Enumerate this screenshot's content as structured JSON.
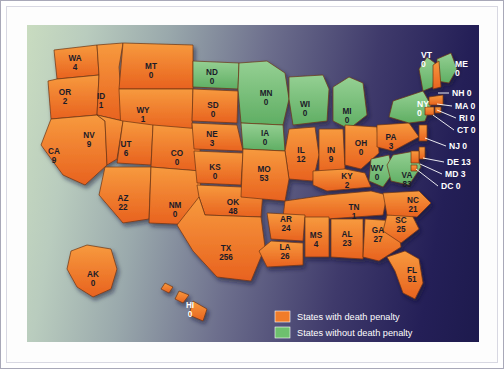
{
  "map": {
    "title": "US death penalty map",
    "background_gradient_from": "#c9dcc0",
    "background_gradient_to": "#1d1a4d",
    "ocean_color": "#1d1a4d",
    "with_penalty_color": "#f07c2a",
    "without_penalty_color": "#7dc67f",
    "border_color": "#6b3312"
  },
  "legend": {
    "items": [
      {
        "key": "with",
        "label": "States with death penalty",
        "color": "#f07c2a"
      },
      {
        "key": "without",
        "label": "States without death penalty",
        "color": "#6ec06e"
      }
    ]
  },
  "chart_data": {
    "type": "map",
    "title": "States with death penalty",
    "value_label": "Executions",
    "categories": [
      "with death penalty",
      "without death penalty"
    ],
    "states": [
      {
        "code": "WA",
        "name": "Washington",
        "value": 4,
        "penalty": "with",
        "x": 48,
        "y": 36,
        "label_anchor": "middle"
      },
      {
        "code": "OR",
        "name": "Oregon",
        "value": 2,
        "penalty": "with",
        "x": 38,
        "y": 70
      },
      {
        "code": "ID",
        "name": "Idaho",
        "value": 1,
        "penalty": "with",
        "x": 74,
        "y": 74
      },
      {
        "code": "MT",
        "name": "Montana",
        "value": 0,
        "penalty": "with",
        "x": 124,
        "y": 44
      },
      {
        "code": "ND",
        "name": "North Dakota",
        "value": 0,
        "penalty": "without",
        "x": 185,
        "y": 50
      },
      {
        "code": "SD",
        "name": "South Dakota",
        "value": 0,
        "penalty": "with",
        "x": 186,
        "y": 83
      },
      {
        "code": "MN",
        "name": "Minnesota",
        "value": 0,
        "penalty": "without",
        "x": 239,
        "y": 71
      },
      {
        "code": "WI",
        "name": "Wisconsin",
        "value": 0,
        "penalty": "without",
        "x": 278,
        "y": 82
      },
      {
        "code": "MI",
        "name": "Michigan",
        "value": 0,
        "penalty": "without",
        "x": 320,
        "y": 89
      },
      {
        "code": "IA",
        "name": "Iowa",
        "value": 0,
        "penalty": "without",
        "x": 238,
        "y": 111
      },
      {
        "code": "WY",
        "name": "Wyoming",
        "value": 1,
        "penalty": "with",
        "x": 116,
        "y": 88
      },
      {
        "code": "NE",
        "name": "Nebraska",
        "value": 3,
        "penalty": "with",
        "x": 185,
        "y": 112
      },
      {
        "code": "NV",
        "name": "Nevada",
        "value": 9,
        "penalty": "with",
        "x": 62,
        "y": 113
      },
      {
        "code": "UT",
        "name": "Utah",
        "value": 6,
        "penalty": "with",
        "x": 99,
        "y": 122
      },
      {
        "code": "CO",
        "name": "Colorado",
        "value": 0,
        "penalty": "with",
        "x": 150,
        "y": 131
      },
      {
        "code": "CA",
        "name": "California",
        "value": 9,
        "penalty": "with",
        "x": 27,
        "y": 129
      },
      {
        "code": "KS",
        "name": "Kansas",
        "value": 0,
        "penalty": "with",
        "x": 188,
        "y": 145
      },
      {
        "code": "MO",
        "name": "Missouri",
        "value": 53,
        "penalty": "with",
        "x": 237,
        "y": 147
      },
      {
        "code": "IL",
        "name": "Illinois",
        "value": 12,
        "penalty": "with",
        "x": 274,
        "y": 128
      },
      {
        "code": "IN",
        "name": "Indiana",
        "value": 9,
        "penalty": "with",
        "x": 304,
        "y": 128
      },
      {
        "code": "OH",
        "name": "Ohio",
        "value": 0,
        "penalty": "with",
        "x": 334,
        "y": 121
      },
      {
        "code": "KY",
        "name": "Kentucky",
        "value": 2,
        "penalty": "with",
        "x": 320,
        "y": 154
      },
      {
        "code": "WV",
        "name": "West Virginia",
        "value": 0,
        "penalty": "without",
        "x": 350,
        "y": 146
      },
      {
        "code": "PA",
        "name": "Pennsylvania",
        "value": 3,
        "penalty": "with",
        "x": 364,
        "y": 115
      },
      {
        "code": "VA",
        "name": "Virginia",
        "value": 83,
        "penalty": "with",
        "x": 380,
        "y": 153
      },
      {
        "code": "NC",
        "name": "North Carolina",
        "value": 21,
        "penalty": "with",
        "x": 386,
        "y": 178
      },
      {
        "code": "SC",
        "name": "South Carolina",
        "value": 25,
        "penalty": "with",
        "x": 374,
        "y": 198
      },
      {
        "code": "TN",
        "name": "Tennessee",
        "value": 1,
        "penalty": "with",
        "x": 327,
        "y": 185
      },
      {
        "code": "AR",
        "name": "Arkansas",
        "value": 24,
        "penalty": "with",
        "x": 259,
        "y": 197
      },
      {
        "code": "MS",
        "name": "Mississippi",
        "value": 4,
        "penalty": "with",
        "x": 289,
        "y": 213
      },
      {
        "code": "AL",
        "name": "Alabama",
        "value": 23,
        "penalty": "with",
        "x": 320,
        "y": 212
      },
      {
        "code": "GA",
        "name": "Georgia",
        "value": 27,
        "penalty": "with",
        "x": 351,
        "y": 208
      },
      {
        "code": "LA",
        "name": "Louisiana",
        "value": 26,
        "penalty": "with",
        "x": 258,
        "y": 225
      },
      {
        "code": "OK",
        "name": "Oklahoma",
        "value": 48,
        "penalty": "with",
        "x": 206,
        "y": 180
      },
      {
        "code": "NM",
        "name": "New Mexico",
        "value": 0,
        "penalty": "with",
        "x": 148,
        "y": 183
      },
      {
        "code": "AZ",
        "name": "Arizona",
        "value": 22,
        "penalty": "with",
        "x": 96,
        "y": 176
      },
      {
        "code": "TX",
        "name": "Texas",
        "value": 256,
        "penalty": "with",
        "x": 199,
        "y": 226
      },
      {
        "code": "FL",
        "name": "Florida",
        "value": 51,
        "penalty": "with",
        "x": 385,
        "y": 248
      },
      {
        "code": "AK",
        "name": "Alaska",
        "value": 0,
        "penalty": "with",
        "x": 66,
        "y": 252
      },
      {
        "code": "HI",
        "name": "Hawaii",
        "value": 0,
        "penalty": "with",
        "x": 163,
        "y": 283
      }
    ],
    "callouts": [
      {
        "code": "VT",
        "name": "Vermont",
        "value": 0,
        "penalty": "without",
        "text": "VT",
        "value_text": "0",
        "tx": 394,
        "ty": 33,
        "stacked": true
      },
      {
        "code": "ME",
        "name": "Maine",
        "value": 0,
        "penalty": "without",
        "text": "ME",
        "value_text": "0",
        "tx": 428,
        "ty": 42,
        "stacked": true
      },
      {
        "code": "NY",
        "name": "New York",
        "value": 0,
        "penalty": "without",
        "text": "NY",
        "value_text": "0",
        "tx": 390,
        "ty": 82,
        "stacked": true
      },
      {
        "code": "NH",
        "name": "New Hampshire",
        "value": 0,
        "penalty": "with",
        "text": "NH 0",
        "tx": 425,
        "ty": 71,
        "lx1": 411,
        "ly1": 68,
        "lx2": 422,
        "ly2": 68
      },
      {
        "code": "MA",
        "name": "Massachusetts",
        "value": 0,
        "penalty": "with",
        "text": "MA 0",
        "tx": 428,
        "ty": 84,
        "lx1": 410,
        "ly1": 79,
        "lx2": 425,
        "ly2": 81
      },
      {
        "code": "RI",
        "name": "Rhode Island",
        "value": 0,
        "penalty": "with",
        "text": "RI 0",
        "tx": 432,
        "ty": 96,
        "lx1": 410,
        "ly1": 85,
        "lx2": 429,
        "ly2": 93
      },
      {
        "code": "CT",
        "name": "Connecticut",
        "value": 0,
        "penalty": "with",
        "text": "CT 0",
        "tx": 430,
        "ty": 108,
        "lx1": 406,
        "ly1": 90,
        "lx2": 427,
        "ly2": 105
      },
      {
        "code": "NJ",
        "name": "New Jersey",
        "value": 0,
        "penalty": "with",
        "text": "NJ 0",
        "tx": 422,
        "ty": 124,
        "lx1": 398,
        "ly1": 113,
        "lx2": 419,
        "ly2": 121
      },
      {
        "code": "DE",
        "name": "Delaware",
        "value": 13,
        "penalty": "with",
        "text": "DE 13",
        "tx": 420,
        "ty": 140,
        "lx1": 396,
        "ly1": 133,
        "lx2": 417,
        "ly2": 137
      },
      {
        "code": "MD",
        "name": "Maryland",
        "value": 3,
        "penalty": "with",
        "text": "MD 3",
        "tx": 418,
        "ty": 152,
        "lx1": 393,
        "ly1": 139,
        "lx2": 415,
        "ly2": 149
      },
      {
        "code": "DC",
        "name": "District of Columbia",
        "value": 0,
        "penalty": "with",
        "text": "DC 0",
        "tx": 414,
        "ty": 164,
        "lx1": 389,
        "ly1": 144,
        "lx2": 411,
        "ly2": 161
      }
    ]
  }
}
